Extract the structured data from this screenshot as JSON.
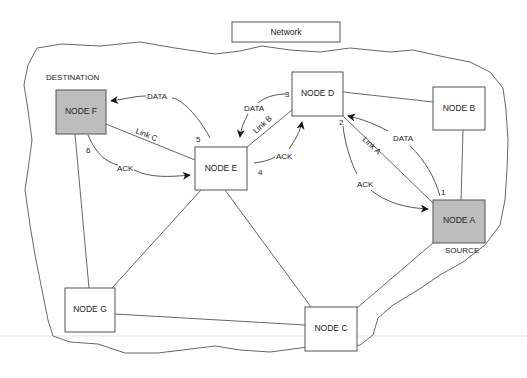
{
  "title": "Network",
  "roles": {
    "destination": "DESTINATION",
    "source": "SOURCE"
  },
  "nodes": {
    "a": {
      "label": "NODE A",
      "shaded": true
    },
    "b": {
      "label": "NODE B",
      "shaded": false
    },
    "c": {
      "label": "NODE C",
      "shaded": false
    },
    "d": {
      "label": "NODE D",
      "shaded": false
    },
    "e": {
      "label": "NODE E",
      "shaded": false
    },
    "f": {
      "label": "NODE F",
      "shaded": true
    },
    "g": {
      "label": "NODE G",
      "shaded": false
    }
  },
  "links": {
    "a": "Link A",
    "b": "Link B",
    "c": "Link C"
  },
  "flows": {
    "data": "DATA",
    "ack": "ACK"
  },
  "steps": [
    "1",
    "2",
    "3",
    "4",
    "5",
    "6"
  ],
  "colors": {
    "shaded_node": "#bdbdbd",
    "stroke": "#555555"
  }
}
